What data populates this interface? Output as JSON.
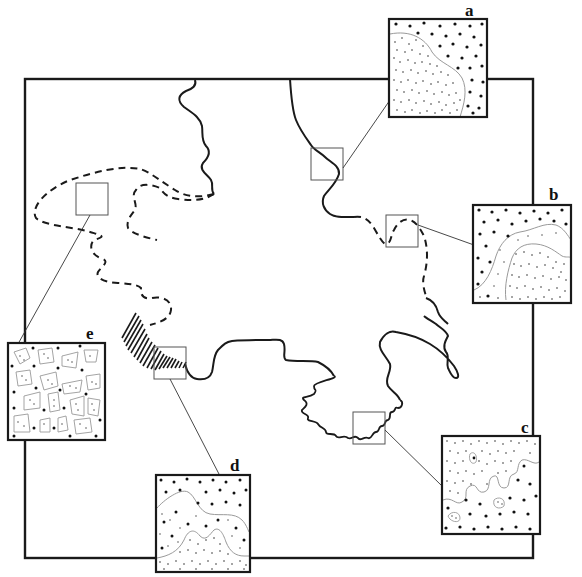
{
  "figure": {
    "colors": {
      "ink": "#1a1a1a",
      "grey_line": "#9a9a9a",
      "background": "#ffffff"
    }
  },
  "insets": [
    {
      "id": "a",
      "label": "a",
      "pattern": "smooth boundary: fine stipple (lower-left) vs coarse dots (upper-right)"
    },
    {
      "id": "b",
      "label": "b",
      "pattern": "lobed boundary: coarse dots (top) vs fine stipple (bottom-right), with transition band"
    },
    {
      "id": "c",
      "label": "c",
      "pattern": "irregular interfingered boundary: fine stipple (top) vs coarse dots (bottom)"
    },
    {
      "id": "d",
      "label": "d",
      "pattern": "two boundaries: coarse dots top, mixed middle, fine stipple bottom bumps"
    },
    {
      "id": "e",
      "label": "e",
      "pattern": "patchy mosaic of stippled polygons among coarse dots"
    }
  ],
  "sample_boxes": [
    {
      "id": "box-e",
      "links_to": "e"
    },
    {
      "id": "box-a",
      "links_to": "a"
    },
    {
      "id": "box-b",
      "links_to": "b"
    },
    {
      "id": "box-d",
      "links_to": "d"
    },
    {
      "id": "box-c",
      "links_to": "c"
    }
  ],
  "boundary_styles": [
    "solid",
    "dashed",
    "hatched",
    "convoluted"
  ]
}
